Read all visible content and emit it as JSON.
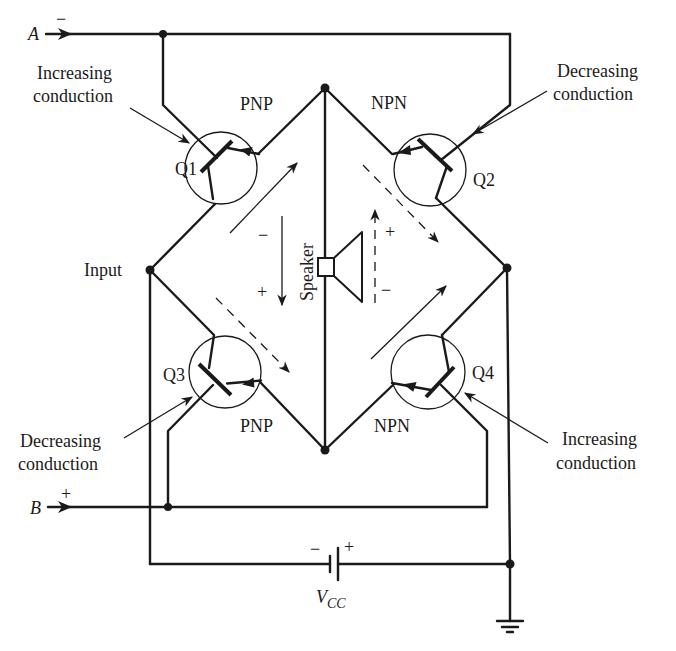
{
  "diagram": {
    "type": "circuit-schematic",
    "title": "",
    "terminals": {
      "a": {
        "name": "A",
        "polarity": "−"
      },
      "b": {
        "name": "B",
        "polarity": "+"
      }
    },
    "input_label": "Input",
    "speaker_label": "Speaker",
    "speaker_polarity_solid": {
      "top": "−",
      "bottom": "+"
    },
    "speaker_polarity_dashed": {
      "top": "+",
      "bottom": "−"
    },
    "supply": {
      "label_main": "V",
      "label_sub": "CC",
      "neg": "−",
      "pos": "+"
    },
    "transistors": [
      {
        "id": "Q1",
        "type": "PNP",
        "annotation_line1": "Increasing",
        "annotation_line2": "conduction"
      },
      {
        "id": "Q2",
        "type": "NPN",
        "annotation_line1": "Decreasing",
        "annotation_line2": "conduction"
      },
      {
        "id": "Q3",
        "type": "PNP",
        "annotation_line1": "Decreasing",
        "annotation_line2": "conduction"
      },
      {
        "id": "Q4",
        "type": "NPN",
        "annotation_line1": "Increasing",
        "annotation_line2": "conduction"
      }
    ],
    "current_arrows": {
      "solid": "Q1 and Q4 path (increasing conduction)",
      "dashed": "Q2 and Q3 path (decreasing conduction)"
    },
    "colors": {
      "ink": "#1a1a1a",
      "paper": "#ffffff"
    }
  }
}
